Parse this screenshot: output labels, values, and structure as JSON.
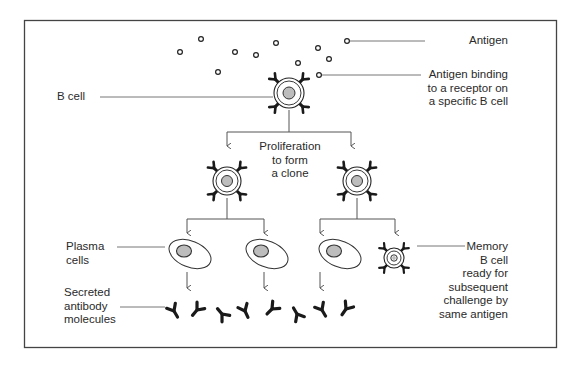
{
  "diagram": {
    "title_hidden": "",
    "colors": {
      "line": "#555555",
      "border": "#444444",
      "receptor": "#1a1a1a",
      "nucleus_fill": "#bdbdbd",
      "background": "#ffffff"
    },
    "labels": {
      "antigen": "Antigen",
      "antigen_binding": "Antigen binding\nto a receptor on\na specific B cell",
      "b_cell": "B cell",
      "proliferation": "Proliferation\nto form\na clone",
      "plasma_cells": "Plasma\ncells",
      "secreted_antibody": "Secreted\nantibody\nmolecules",
      "memory_b_cell": "Memory\nB cell\nready for\nsubsequent\nchallenge by\nsame antigen"
    },
    "antigens": [
      [
        201,
        39
      ],
      [
        180,
        52
      ],
      [
        235,
        52
      ],
      [
        256,
        55
      ],
      [
        276,
        43
      ],
      [
        318,
        48
      ],
      [
        329,
        59
      ],
      [
        298,
        63
      ],
      [
        218,
        72
      ],
      [
        347,
        41
      ]
    ],
    "b_cells": [
      {
        "id": "initial-b-cell",
        "cx": 289,
        "cy": 93,
        "r": 15,
        "nr": 6,
        "bound_antigen": [
          319,
          75
        ]
      },
      {
        "id": "clone-b-cell-left",
        "cx": 227,
        "cy": 181,
        "r": 14,
        "nr": 5.5
      },
      {
        "id": "clone-b-cell-right",
        "cx": 357,
        "cy": 181,
        "r": 14,
        "nr": 5.5
      }
    ],
    "memory_cell": {
      "cx": 394,
      "cy": 258,
      "r": 10,
      "nr": 3.2
    },
    "plasma_cells": [
      {
        "cx": 187,
        "cy": 253
      },
      {
        "cx": 264,
        "cy": 253
      },
      {
        "cx": 337,
        "cy": 253
      }
    ],
    "antibodies": [
      {
        "x": 174,
        "y": 311,
        "rot": -30
      },
      {
        "x": 197,
        "y": 310,
        "rot": 40
      },
      {
        "x": 222,
        "y": 314,
        "rot": 140
      },
      {
        "x": 245,
        "y": 311,
        "rot": -25
      },
      {
        "x": 272,
        "y": 309,
        "rot": 45
      },
      {
        "x": 297,
        "y": 314,
        "rot": 150
      },
      {
        "x": 322,
        "y": 310,
        "rot": -30
      },
      {
        "x": 346,
        "y": 309,
        "rot": 35
      }
    ]
  }
}
